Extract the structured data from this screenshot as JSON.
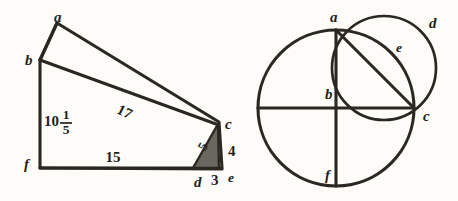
{
  "plate": {
    "title": "Geometric construction plate",
    "background_color": "#fdfcf9",
    "ink_color": "#2b2721",
    "shade_color": "#6a675e"
  },
  "figures": [
    {
      "id": "left-figure",
      "name": "shaded-right-triangle-figure",
      "description": "Polygon a-b-f-d-c with an inset shaded right triangle d-c-e",
      "vertex_labels": [
        {
          "key": "a",
          "text": "a",
          "x": 54,
          "y": 19
        },
        {
          "key": "b",
          "text": "b",
          "x": 25,
          "y": 62
        },
        {
          "key": "f",
          "text": "f",
          "x": 24,
          "y": 166
        },
        {
          "key": "d",
          "text": "d",
          "x": 194,
          "y": 184
        },
        {
          "key": "c",
          "text": "c",
          "x": 225,
          "y": 126
        },
        {
          "key": "e",
          "text": "e",
          "x": 228,
          "y": 179
        }
      ],
      "measure_labels": [
        {
          "key": "bf",
          "text": "10",
          "fraction_numerator": "1",
          "fraction_denominator": "5",
          "x": 44,
          "y": 123
        },
        {
          "key": "bc",
          "text": "17",
          "x": 124,
          "y": 113,
          "rotation": 27
        },
        {
          "key": "fd",
          "text": "15",
          "x": 113,
          "y": 159
        },
        {
          "key": "dc",
          "text": "5",
          "x": 204,
          "y": 147,
          "rotation": -62
        },
        {
          "key": "ce",
          "text": "4",
          "x": 228,
          "y": 153
        },
        {
          "key": "de",
          "text": "3",
          "x": 211,
          "y": 182
        }
      ]
    },
    {
      "id": "right-figure",
      "name": "two-circles-figure",
      "description": "Large circle with vertical diameter a-f and horizontal diameter through b to c, a smaller circle through a and c, and chord a-c",
      "vertex_labels": [
        {
          "key": "a",
          "text": "a",
          "x": 330,
          "y": 19
        },
        {
          "key": "b",
          "text": "b",
          "x": 325,
          "y": 96
        },
        {
          "key": "c",
          "text": "c",
          "x": 423,
          "y": 118
        },
        {
          "key": "d",
          "text": "d",
          "x": 429,
          "y": 25
        },
        {
          "key": "e",
          "text": "e",
          "x": 396,
          "y": 49
        },
        {
          "key": "f",
          "text": "f",
          "x": 325,
          "y": 177
        }
      ]
    }
  ]
}
